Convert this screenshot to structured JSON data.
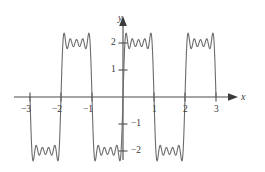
{
  "chart_data": {
    "type": "line",
    "title": "",
    "subtitle": "",
    "xlabel": "x",
    "ylabel": "y",
    "xlim": [
      -3.35,
      3.25
    ],
    "ylim": [
      -2.65,
      2.55
    ],
    "grid": false,
    "legend": null,
    "annotations": [],
    "series": [
      {
        "name": "fourier-partial-sum",
        "color": "#6b6b6b",
        "waveform": "square",
        "amplitude": 2,
        "period": 2,
        "harmonics": 9,
        "ripple_count_per_segment": 5,
        "segments": [
          {
            "x_start": -3,
            "x_end": -2,
            "level": -2
          },
          {
            "x_start": -2,
            "x_end": -1,
            "level": 2
          },
          {
            "x_start": -1,
            "x_end": 0,
            "level": -2
          },
          {
            "x_start": 0,
            "x_end": 1,
            "level": 2
          },
          {
            "x_start": 1,
            "x_end": 2,
            "level": -2
          },
          {
            "x_start": 2,
            "x_end": 3,
            "level": 2
          }
        ]
      }
    ],
    "x_ticks": [
      {
        "value": -3,
        "label": "−3"
      },
      {
        "value": -2,
        "label": "−2"
      },
      {
        "value": -1,
        "label": "−1"
      },
      {
        "value": 1,
        "label": "1"
      },
      {
        "value": 2,
        "label": "2"
      },
      {
        "value": 3,
        "label": "3"
      }
    ],
    "y_ticks": [
      {
        "value": 2,
        "label": "2"
      },
      {
        "value": 1,
        "label": "1"
      },
      {
        "value": -1,
        "label": "−1"
      },
      {
        "value": -2,
        "label": "−2"
      }
    ],
    "axis_color": "#4a4a4a",
    "curve_color": "#6b6b6b",
    "background_color": "#ffffff"
  },
  "axes": {
    "x_axis_name": "x",
    "y_axis_name": "y"
  }
}
